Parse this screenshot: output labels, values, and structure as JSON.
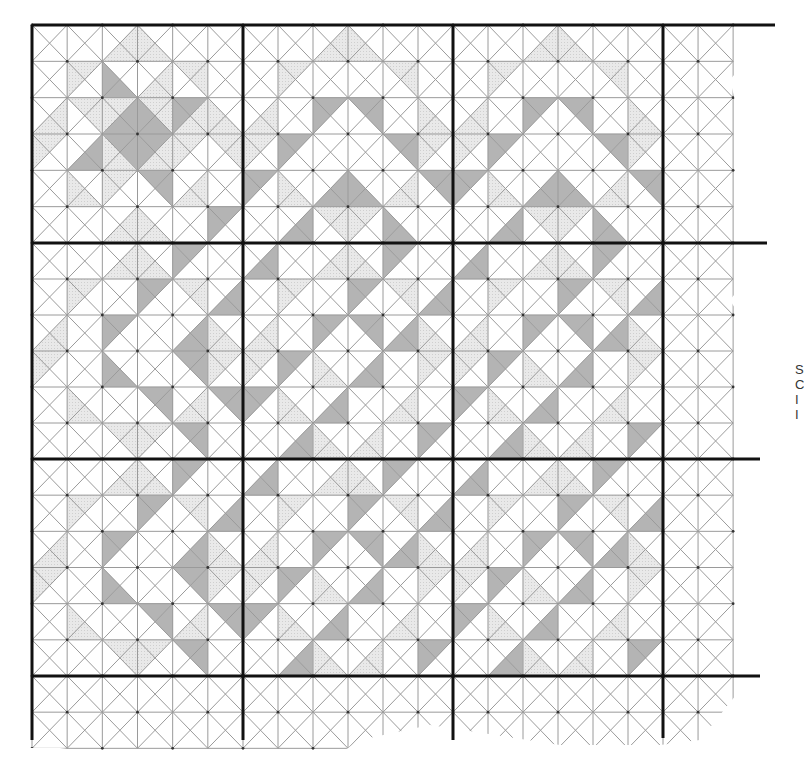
{
  "diagram": {
    "type": "quilt-block-grid",
    "blocks_across": 3,
    "blocks_down": 3,
    "cells_per_block": 6,
    "cell_division": "each square split by both diagonals into 4 triangles (T,R,B,L)",
    "extra_columns_right": 2,
    "extra_rows_bottom": 2,
    "colors": {
      "background": "#ffffff",
      "thin_line": "#9a9a9a",
      "thick_line": "#111111",
      "light_fill": "#e4e4e4",
      "dark_fill": "#b4b4b4",
      "node_dot": "#333333"
    },
    "legend_shading": {
      "0": "white",
      "1": "light gray (dotted)",
      "2": "medium gray"
    },
    "block_types": {
      "A": [
        [
          [
            0,
            0,
            0,
            0
          ],
          [
            0,
            0,
            0,
            0
          ],
          [
            0,
            1,
            1,
            0
          ],
          [
            0,
            0,
            1,
            1
          ],
          [
            0,
            0,
            0,
            0
          ],
          [
            0,
            0,
            0,
            0
          ]
        ],
        [
          [
            0,
            0,
            0,
            0
          ],
          [
            1,
            0,
            0,
            1
          ],
          [
            0,
            0,
            2,
            2
          ],
          [
            0,
            1,
            1,
            0
          ],
          [
            1,
            1,
            0,
            0
          ],
          [
            0,
            0,
            0,
            0
          ]
        ],
        [
          [
            0,
            1,
            1,
            0
          ],
          [
            1,
            1,
            0,
            0
          ],
          [
            1,
            2,
            2,
            1
          ],
          [
            1,
            1,
            2,
            2
          ],
          [
            2,
            1,
            1,
            2
          ],
          [
            0,
            0,
            1,
            1
          ]
        ],
        [
          [
            1,
            0,
            0,
            1
          ],
          [
            0,
            2,
            2,
            0
          ],
          [
            2,
            2,
            1,
            1
          ],
          [
            2,
            1,
            1,
            2
          ],
          [
            1,
            0,
            0,
            1
          ],
          [
            1,
            1,
            0,
            0
          ]
        ],
        [
          [
            0,
            0,
            0,
            0
          ],
          [
            0,
            0,
            1,
            1
          ],
          [
            1,
            0,
            0,
            1
          ],
          [
            2,
            2,
            0,
            0
          ],
          [
            0,
            1,
            1,
            0
          ],
          [
            0,
            0,
            0,
            0
          ]
        ],
        [
          [
            0,
            0,
            0,
            0
          ],
          [
            0,
            0,
            0,
            0
          ],
          [
            0,
            1,
            1,
            0
          ],
          [
            0,
            0,
            1,
            1
          ],
          [
            0,
            0,
            0,
            0
          ],
          [
            2,
            0,
            0,
            2
          ]
        ]
      ],
      "B": [
        [
          [
            0,
            0,
            0,
            0
          ],
          [
            0,
            0,
            0,
            0
          ],
          [
            0,
            1,
            1,
            0
          ],
          [
            0,
            0,
            1,
            1
          ],
          [
            0,
            0,
            0,
            0
          ],
          [
            0,
            0,
            0,
            0
          ]
        ],
        [
          [
            0,
            0,
            0,
            0
          ],
          [
            1,
            0,
            0,
            1
          ],
          [
            0,
            0,
            0,
            0
          ],
          [
            0,
            0,
            0,
            0
          ],
          [
            1,
            1,
            0,
            0
          ],
          [
            0,
            0,
            0,
            0
          ]
        ],
        [
          [
            0,
            1,
            1,
            0
          ],
          [
            0,
            0,
            0,
            0
          ],
          [
            2,
            0,
            0,
            2
          ],
          [
            2,
            2,
            0,
            0
          ],
          [
            0,
            0,
            0,
            0
          ],
          [
            0,
            0,
            1,
            1
          ]
        ],
        [
          [
            1,
            0,
            0,
            1
          ],
          [
            2,
            0,
            0,
            2
          ],
          [
            0,
            0,
            0,
            0
          ],
          [
            0,
            0,
            0,
            0
          ],
          [
            2,
            2,
            0,
            0
          ],
          [
            1,
            0,
            0,
            1
          ]
        ],
        [
          [
            2,
            0,
            0,
            2
          ],
          [
            0,
            0,
            1,
            1
          ],
          [
            0,
            2,
            2,
            0
          ],
          [
            0,
            0,
            2,
            2
          ],
          [
            0,
            1,
            1,
            0
          ],
          [
            2,
            2,
            0,
            0
          ]
        ],
        [
          [
            0,
            0,
            0,
            0
          ],
          [
            0,
            2,
            2,
            0
          ],
          [
            1,
            1,
            0,
            0
          ],
          [
            1,
            0,
            0,
            1
          ],
          [
            0,
            0,
            2,
            2
          ],
          [
            0,
            0,
            0,
            0
          ]
        ]
      ],
      "C": [
        [
          [
            0,
            0,
            0,
            0
          ],
          [
            0,
            0,
            0,
            0
          ],
          [
            0,
            1,
            1,
            0
          ],
          [
            0,
            0,
            1,
            1
          ],
          [
            2,
            0,
            0,
            2
          ],
          [
            0,
            0,
            0,
            0
          ]
        ],
        [
          [
            0,
            0,
            0,
            0
          ],
          [
            1,
            0,
            0,
            1
          ],
          [
            0,
            0,
            0,
            0
          ],
          [
            2,
            0,
            0,
            2
          ],
          [
            1,
            1,
            0,
            0
          ],
          [
            0,
            2,
            2,
            0
          ]
        ],
        [
          [
            0,
            1,
            1,
            0
          ],
          [
            0,
            0,
            0,
            0
          ],
          [
            2,
            0,
            0,
            2
          ],
          [
            0,
            0,
            0,
            0
          ],
          [
            0,
            2,
            2,
            0
          ],
          [
            0,
            0,
            1,
            1
          ]
        ],
        [
          [
            1,
            0,
            0,
            1
          ],
          [
            0,
            0,
            0,
            0
          ],
          [
            0,
            0,
            2,
            2
          ],
          [
            0,
            0,
            0,
            0
          ],
          [
            2,
            2,
            0,
            0
          ],
          [
            1,
            0,
            0,
            1
          ]
        ],
        [
          [
            0,
            0,
            0,
            0
          ],
          [
            0,
            0,
            1,
            1
          ],
          [
            0,
            0,
            0,
            0
          ],
          [
            2,
            2,
            0,
            0
          ],
          [
            0,
            1,
            1,
            0
          ],
          [
            2,
            2,
            0,
            0
          ]
        ],
        [
          [
            0,
            0,
            0,
            0
          ],
          [
            0,
            0,
            0,
            0
          ],
          [
            1,
            1,
            0,
            0
          ],
          [
            1,
            0,
            0,
            1
          ],
          [
            2,
            2,
            0,
            0
          ],
          [
            0,
            0,
            0,
            0
          ]
        ]
      ],
      "D": [
        [
          [
            0,
            2,
            2,
            0
          ],
          [
            0,
            0,
            0,
            0
          ],
          [
            0,
            1,
            1,
            0
          ],
          [
            0,
            0,
            1,
            1
          ],
          [
            2,
            0,
            0,
            2
          ],
          [
            0,
            0,
            0,
            0
          ]
        ],
        [
          [
            0,
            0,
            0,
            0
          ],
          [
            1,
            0,
            0,
            1
          ],
          [
            0,
            0,
            0,
            0
          ],
          [
            2,
            0,
            0,
            2
          ],
          [
            1,
            1,
            0,
            0
          ],
          [
            0,
            2,
            2,
            0
          ]
        ],
        [
          [
            0,
            1,
            1,
            0
          ],
          [
            0,
            0,
            0,
            0
          ],
          [
            2,
            0,
            0,
            2
          ],
          [
            2,
            2,
            0,
            0
          ],
          [
            0,
            2,
            2,
            0
          ],
          [
            0,
            0,
            1,
            1
          ]
        ],
        [
          [
            1,
            0,
            0,
            1
          ],
          [
            2,
            0,
            0,
            2
          ],
          [
            0,
            0,
            1,
            1
          ],
          [
            0,
            2,
            2,
            0
          ],
          [
            0,
            0,
            0,
            0
          ],
          [
            1,
            0,
            0,
            1
          ]
        ],
        [
          [
            2,
            0,
            0,
            2
          ],
          [
            0,
            0,
            1,
            1
          ],
          [
            0,
            2,
            2,
            0
          ],
          [
            0,
            0,
            0,
            0
          ],
          [
            0,
            1,
            1,
            0
          ],
          [
            0,
            0,
            0,
            0
          ]
        ],
        [
          [
            0,
            0,
            0,
            0
          ],
          [
            0,
            2,
            2,
            0
          ],
          [
            0,
            0,
            1,
            1
          ],
          [
            0,
            1,
            1,
            0
          ],
          [
            0,
            0,
            0,
            0
          ],
          [
            2,
            0,
            0,
            2
          ]
        ]
      ]
    },
    "layout": [
      [
        "A",
        "B",
        "B"
      ],
      [
        "C",
        "D",
        "D"
      ],
      [
        "C",
        "D",
        "D"
      ]
    ],
    "geometry": {
      "origin_x": 32,
      "origin_y": 25,
      "block_x": [
        32,
        243,
        453,
        663
      ],
      "block_y": [
        25,
        243,
        459,
        676
      ],
      "grid_right_x": 733,
      "grid_bottom_y": 748
    },
    "edge_text_fragments": [
      "S",
      "C",
      "I",
      "I"
    ]
  }
}
